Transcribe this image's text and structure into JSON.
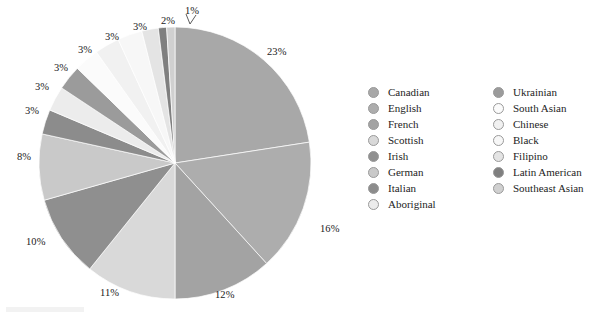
{
  "chart_data": {
    "type": "pie",
    "title": "",
    "subtitle": "",
    "xlabel": "",
    "ylabel": "",
    "legend_position": "right",
    "start_angle_deg": 0,
    "direction": "clockwise",
    "categories": [
      "Canadian",
      "English",
      "French",
      "Scottish",
      "Irish",
      "German",
      "Italian",
      "Aboriginal",
      "Ukrainian",
      "South Asian",
      "Chinese",
      "Black",
      "Filipino",
      "Latin American",
      "Southeast Asian"
    ],
    "values": [
      23,
      16,
      12,
      11,
      10,
      8,
      3,
      3,
      3,
      3,
      3,
      3,
      2,
      1,
      1
    ],
    "value_labels": [
      "23%",
      "16%",
      "12%",
      "11%",
      "10%",
      "8%",
      "3%",
      "3%",
      "3%",
      "3%",
      "3%",
      "3%",
      "2%",
      "1%",
      ""
    ],
    "colors": [
      "#a8a8a8",
      "#adadad",
      "#a3a3a3",
      "#d9d9d9",
      "#8f8f8f",
      "#c9c9c9",
      "#8c8c8c",
      "#ececec",
      "#9b9b9b",
      "#fbfbfb",
      "#f1f1f1",
      "#f7f7f7",
      "#e4e4e4",
      "#7f7f7f",
      "#d0d0d0"
    ],
    "slices": [
      {
        "label": "Canadian",
        "value": 23,
        "display": "23%",
        "color": "#a8a8a8"
      },
      {
        "label": "English",
        "value": 16,
        "display": "16%",
        "color": "#adadad"
      },
      {
        "label": "French",
        "value": 12,
        "display": "12%",
        "color": "#a3a3a3"
      },
      {
        "label": "Scottish",
        "value": 11,
        "display": "11%",
        "color": "#d9d9d9"
      },
      {
        "label": "Irish",
        "value": 10,
        "display": "10%",
        "color": "#8f8f8f"
      },
      {
        "label": "German",
        "value": 8,
        "display": "8%",
        "color": "#c9c9c9"
      },
      {
        "label": "Italian",
        "value": 3,
        "display": "3%",
        "color": "#8c8c8c"
      },
      {
        "label": "Aboriginal",
        "value": 3,
        "display": "3%",
        "color": "#ececec"
      },
      {
        "label": "Ukrainian",
        "value": 3,
        "display": "3%",
        "color": "#9b9b9b"
      },
      {
        "label": "South Asian",
        "value": 3,
        "display": "3%",
        "color": "#fbfbfb"
      },
      {
        "label": "Chinese",
        "value": 3,
        "display": "3%",
        "color": "#f1f1f1"
      },
      {
        "label": "Black",
        "value": 3,
        "display": "3%",
        "color": "#f7f7f7"
      },
      {
        "label": "Filipino",
        "value": 2,
        "display": "2%",
        "color": "#e4e4e4"
      },
      {
        "label": "Latin American",
        "value": 1,
        "display": "1%",
        "color": "#7f7f7f"
      },
      {
        "label": "Southeast Asian",
        "value": 1,
        "display": "",
        "color": "#d0d0d0"
      }
    ]
  },
  "legend": {
    "column_1": [
      {
        "label": "Canadian",
        "color": "#a8a8a8"
      },
      {
        "label": "English",
        "color": "#adadad"
      },
      {
        "label": "French",
        "color": "#a3a3a3"
      },
      {
        "label": "Scottish",
        "color": "#d9d9d9"
      },
      {
        "label": "Irish",
        "color": "#8f8f8f"
      },
      {
        "label": "German",
        "color": "#c9c9c9"
      },
      {
        "label": "Italian",
        "color": "#8c8c8c"
      },
      {
        "label": "Aboriginal",
        "color": "#ececec"
      }
    ],
    "column_2": [
      {
        "label": "Ukrainian",
        "color": "#9b9b9b"
      },
      {
        "label": "South Asian",
        "color": "#fbfbfb"
      },
      {
        "label": "Chinese",
        "color": "#f1f1f1"
      },
      {
        "label": "Black",
        "color": "#f7f7f7"
      },
      {
        "label": "Filipino",
        "color": "#e4e4e4"
      },
      {
        "label": "Latin American",
        "color": "#7f7f7f"
      },
      {
        "label": "Southeast Asian",
        "color": "#d0d0d0"
      }
    ]
  },
  "labels": [
    {
      "text": "23%",
      "x": 267,
      "y": 47
    },
    {
      "text": "16%",
      "x": 320,
      "y": 224
    },
    {
      "text": "12%",
      "x": 215,
      "y": 290
    },
    {
      "text": "11%",
      "x": 100,
      "y": 288
    },
    {
      "text": "10%",
      "x": 26,
      "y": 237
    },
    {
      "text": "8%",
      "x": 17,
      "y": 152
    },
    {
      "text": "3%",
      "x": 25,
      "y": 106
    },
    {
      "text": "3%",
      "x": 35,
      "y": 82
    },
    {
      "text": "3%",
      "x": 54,
      "y": 63
    },
    {
      "text": "3%",
      "x": 78,
      "y": 45
    },
    {
      "text": "3%",
      "x": 105,
      "y": 32
    },
    {
      "text": "3%",
      "x": 133,
      "y": 22
    },
    {
      "text": "2%",
      "x": 161,
      "y": 16
    },
    {
      "text": "1%",
      "x": 185,
      "y": 6
    }
  ],
  "pie_geometry": {
    "center_x": 175,
    "center_y": 163,
    "radius": 136
  },
  "colors": {
    "background": "#ffffff",
    "text": "#1a1a1a",
    "swatch_border": "#9a9a9a",
    "slice_border": "#ffffff"
  }
}
